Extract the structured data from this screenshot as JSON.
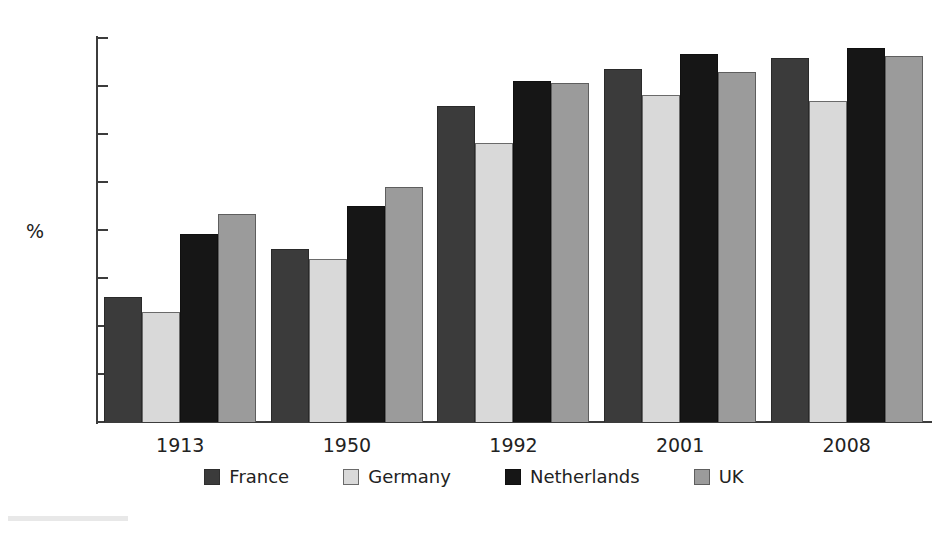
{
  "chart_data": {
    "type": "bar",
    "title": "",
    "xlabel": "",
    "ylabel": "%",
    "ylim": [
      0,
      80
    ],
    "yticks": [
      0,
      10,
      20,
      30,
      40,
      50,
      60,
      70,
      80
    ],
    "ytick_labels": [
      "0",
      "10",
      "20",
      "30",
      "40",
      "50",
      "60",
      "70",
      "80"
    ],
    "grid": false,
    "legend_position": "bottom",
    "categories": [
      "1913",
      "1950",
      "1992",
      "2001",
      "2008"
    ],
    "series": [
      {
        "name": "France",
        "color": "#3b3b3b",
        "values": [
          26.0,
          36.0,
          65.8,
          73.6,
          75.8
        ]
      },
      {
        "name": "Germany",
        "color": "#d9d9d9",
        "values": [
          23.0,
          34.0,
          58.2,
          68.2,
          66.8
        ]
      },
      {
        "name": "Netherlands",
        "color": "#161616",
        "values": [
          39.2,
          45.0,
          71.0,
          76.7,
          78.0
        ]
      },
      {
        "name": "UK",
        "color": "#9b9b9b",
        "values": [
          43.3,
          49.0,
          70.7,
          72.9,
          76.2
        ]
      }
    ]
  },
  "axis": {
    "unit_label": "%"
  },
  "colors": {
    "axis": "#3c3c3c",
    "text": "#222222",
    "background": "#ffffff"
  }
}
